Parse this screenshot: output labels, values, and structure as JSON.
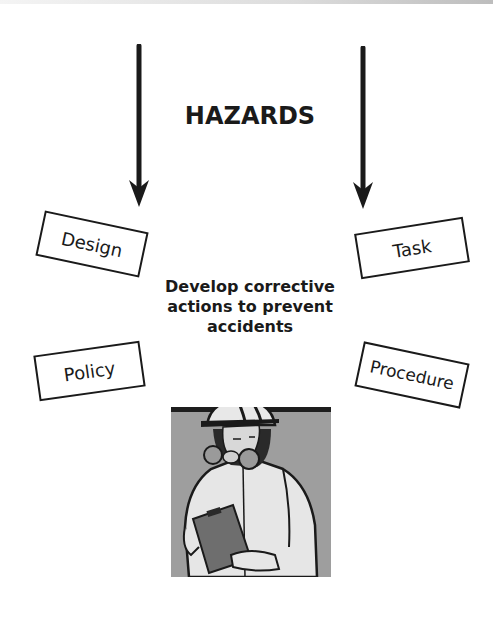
{
  "diagram": {
    "title": "HAZARDS",
    "center_text_lines": [
      "Develop corrective",
      "actions to prevent",
      "accidents"
    ],
    "boxes": {
      "design": "Design",
      "task": "Task",
      "policy": "Policy",
      "procedure": "Procedure"
    },
    "arrows": [
      {
        "direction": "down",
        "position": "left"
      },
      {
        "direction": "down",
        "position": "right"
      }
    ],
    "illustration": "worker-with-respirator-and-clipboard"
  },
  "colors": {
    "ink": "#1a1a1a",
    "background": "#ffffff",
    "illustration_bg": "#9e9e9e",
    "suit": "#e6e6e6",
    "clipboard": "#6e6e6e"
  }
}
